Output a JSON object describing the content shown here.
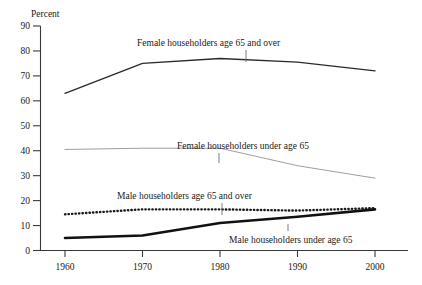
{
  "chart_data": {
    "type": "line",
    "title": "",
    "ylabel": "Percent",
    "xlabel": "",
    "ylim": [
      0,
      90
    ],
    "yticks": [
      0,
      10,
      20,
      30,
      40,
      50,
      60,
      70,
      80,
      90
    ],
    "x": [
      1960,
      1970,
      1980,
      1990,
      2000
    ],
    "xtick_labels": [
      "1960",
      "1970",
      "1980",
      "1990",
      "2000"
    ],
    "grid": false,
    "legend_position": "inline-annotations",
    "series": [
      {
        "name": "Female householders age 65 and over",
        "values": [
          63,
          75,
          77,
          75.5,
          72
        ],
        "style": "thin-solid",
        "color": "#2b2b2b"
      },
      {
        "name": "Female householders under age 65",
        "values": [
          40.5,
          41,
          41,
          34,
          29
        ],
        "style": "hairline-solid",
        "color": "#8c8c8c"
      },
      {
        "name": "Male householders age 65 and over",
        "values": [
          14.5,
          16.5,
          16.5,
          16,
          17
        ],
        "style": "dotted",
        "color": "#1a1a1a"
      },
      {
        "name": "Male householders under age 65",
        "values": [
          5,
          6,
          11,
          13.5,
          16.5
        ],
        "style": "thick-solid",
        "color": "#111111"
      }
    ],
    "annotations": [
      {
        "text": "Female householders age 65 and over",
        "series": "Female householders age 65 and over"
      },
      {
        "text": "Female householders under age 65",
        "series": "Female householders under age 65"
      },
      {
        "text": "Male householders age 65 and over",
        "series": "Male householders age 65 and over"
      },
      {
        "text": "Male householders under age 65",
        "series": "Male householders under age 65"
      }
    ]
  }
}
